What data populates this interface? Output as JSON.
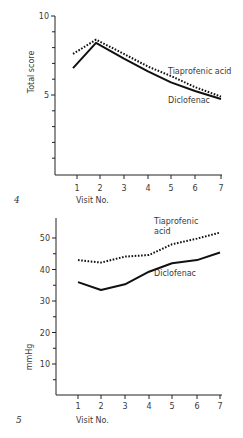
{
  "chart_data": [
    {
      "type": "line",
      "figure_label": "4",
      "title": "",
      "xlabel": "Visit No.",
      "ylabel": "Total score",
      "x": [
        1,
        2,
        3,
        4,
        5,
        6,
        7
      ],
      "x_tick_labels": [
        "1",
        "2",
        "3",
        "4",
        "5",
        "6",
        "7"
      ],
      "y_tick_labels": [
        {
          "value": 10,
          "label": "10"
        },
        {
          "value": 5,
          "label": "5"
        }
      ],
      "y_minor_ticks": [
        1,
        2,
        3,
        4,
        6,
        7,
        8,
        9
      ],
      "ylim": [
        0,
        10
      ],
      "xlim": [
        0,
        7
      ],
      "grid": false,
      "series": [
        {
          "name": "Tiaprofenic acid",
          "style": "dotted",
          "values": [
            7.6,
            8.5,
            7.6,
            6.8,
            6.2,
            5.5,
            4.9
          ]
        },
        {
          "name": "Diclofenac",
          "style": "solid",
          "values": [
            6.7,
            8.3,
            7.3,
            6.5,
            5.8,
            5.25,
            4.75
          ]
        }
      ],
      "annotations": [
        {
          "text": "Tiaprofenic acid",
          "series": "Tiaprofenic acid"
        },
        {
          "text": "Diclofenac",
          "series": "Diclofenac"
        }
      ]
    },
    {
      "type": "line",
      "figure_label": "5",
      "title": "",
      "xlabel": "Visit No.",
      "ylabel": "mmHg",
      "x": [
        1,
        2,
        3,
        4,
        5,
        6,
        7
      ],
      "x_tick_labels": [
        "1",
        "2",
        "3",
        "4",
        "5",
        "6",
        "7"
      ],
      "y_tick_labels": [
        {
          "value": 50,
          "label": "50"
        },
        {
          "value": 40,
          "label": "40"
        },
        {
          "value": 30,
          "label": "30"
        },
        {
          "value": 20,
          "label": "20"
        },
        {
          "value": 10,
          "label": "10"
        }
      ],
      "y_minor_ticks": [
        5,
        15,
        25,
        35,
        45
      ],
      "ylim": [
        0,
        56
      ],
      "xlim": [
        0,
        7
      ],
      "grid": false,
      "series": [
        {
          "name": "Tiaprofenic acid",
          "style": "dotted",
          "values": [
            43,
            42.2,
            44.1,
            44.6,
            48,
            49.8,
            51.7
          ]
        },
        {
          "name": "Diclofenac",
          "style": "solid",
          "values": [
            36,
            33.5,
            35.3,
            39.3,
            42,
            43,
            45.4
          ]
        }
      ],
      "annotations": [
        {
          "text": "Tiaprofenic",
          "series": "Tiaprofenic acid"
        },
        {
          "text": "acid",
          "series": "Tiaprofenic acid"
        },
        {
          "text": "Diclofenac",
          "series": "Diclofenac"
        }
      ]
    }
  ]
}
